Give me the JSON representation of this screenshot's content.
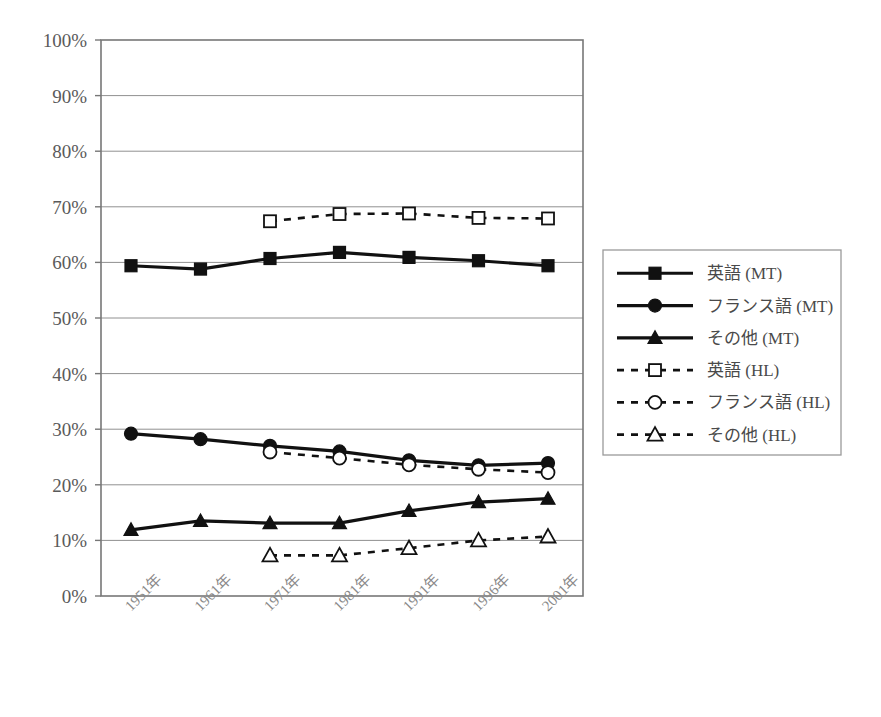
{
  "chart_data": {
    "type": "line",
    "title": "",
    "subtitle": "",
    "xlabel": "",
    "ylabel": "",
    "grid": true,
    "legend_position": "right",
    "ylim": [
      0,
      100
    ],
    "y_ticks": [
      "0%",
      "10%",
      "20%",
      "30%",
      "40%",
      "50%",
      "60%",
      "70%",
      "80%",
      "90%",
      "100%"
    ],
    "y_tick_values": [
      0,
      10,
      20,
      30,
      40,
      50,
      60,
      70,
      80,
      90,
      100
    ],
    "categories": [
      "1951年",
      "1961年",
      "1971年",
      "1981年",
      "1991年",
      "1996年",
      "2001年"
    ],
    "series": [
      {
        "name": "英語 (MT)",
        "marker": "filled-square",
        "line": "solid",
        "values": [
          59.4,
          58.8,
          60.7,
          61.8,
          60.9,
          60.3,
          59.4
        ]
      },
      {
        "name": "フランス語 (MT)",
        "marker": "filled-circle",
        "line": "solid",
        "values": [
          29.2,
          28.2,
          27.0,
          26.0,
          24.4,
          23.5,
          23.9
        ]
      },
      {
        "name": "その他 (MT)",
        "marker": "filled-triangle",
        "line": "solid",
        "values": [
          11.9,
          13.5,
          13.1,
          13.1,
          15.3,
          16.9,
          17.5
        ]
      },
      {
        "name": "英語 (HL)",
        "marker": "open-square",
        "line": "dashed",
        "values": [
          null,
          null,
          67.4,
          68.7,
          68.8,
          68.0,
          67.9
        ]
      },
      {
        "name": "フランス語 (HL)",
        "marker": "open-circle",
        "line": "dashed",
        "values": [
          null,
          null,
          25.9,
          24.8,
          23.6,
          22.8,
          22.2
        ]
      },
      {
        "name": "その他 (HL)",
        "marker": "open-triangle",
        "line": "dashed",
        "values": [
          null,
          null,
          7.3,
          7.3,
          8.6,
          10.0,
          10.7
        ]
      }
    ]
  },
  "legend": {
    "items": [
      {
        "label": "英語 (MT)",
        "marker": "filled-square",
        "line": "solid"
      },
      {
        "label": "フランス語 (MT)",
        "marker": "filled-circle",
        "line": "solid"
      },
      {
        "label": "その他 (MT)",
        "marker": "filled-triangle",
        "line": "solid"
      },
      {
        "label": "英語 (HL)",
        "marker": "open-square",
        "line": "dashed"
      },
      {
        "label": "フランス語 (HL)",
        "marker": "open-circle",
        "line": "dashed"
      },
      {
        "label": "その他 (HL)",
        "marker": "open-triangle",
        "line": "dashed"
      }
    ]
  },
  "colors": {
    "series": "#111111",
    "grid": "#909090",
    "frame": "#777777",
    "axis_text": "#5a5a5a",
    "tick_text": "#8a8a8a",
    "legend_text": "#4a4a4a",
    "background": "#ffffff"
  },
  "geometry": {
    "plot_left": 101,
    "plot_right": 583,
    "plot_top": 40,
    "plot_bottom": 596,
    "first_point_x": 131,
    "point_spacing": 69.5,
    "legend_x": 603,
    "legend_y": 250,
    "legend_w": 238,
    "legend_h": 205
  }
}
